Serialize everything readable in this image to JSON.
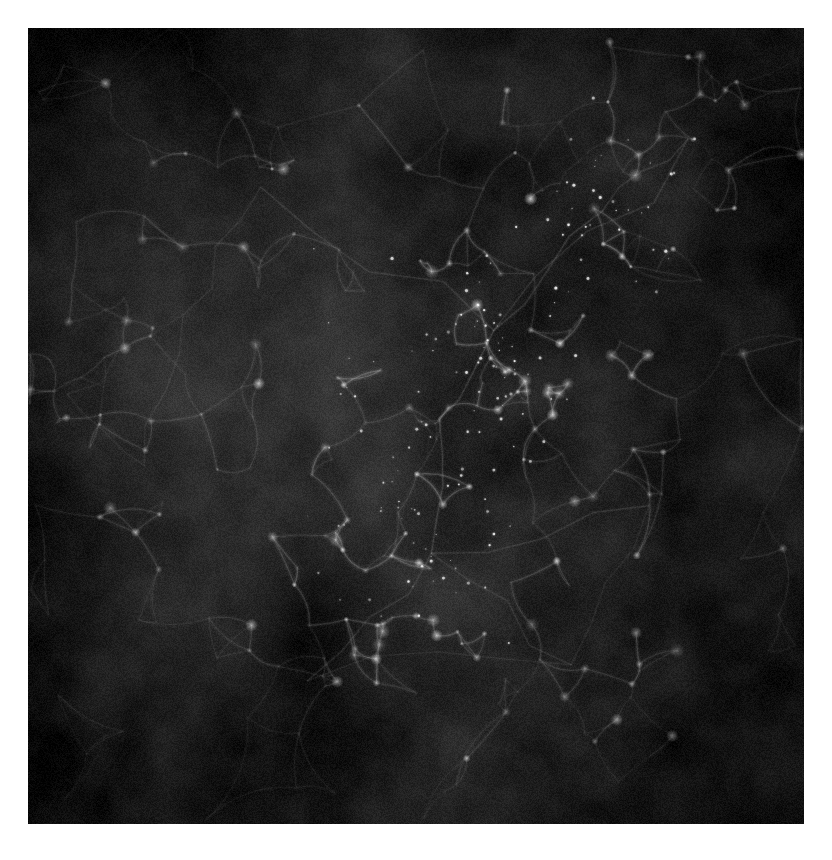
{
  "image": {
    "description": "Grayscale cosmological simulation image of the cosmic web: faint wispy gas filaments and small bright knots forming a network that converges on a dense central cluster, set against a dark mottled, grainy background with a white page margin.",
    "background_page_color": "#ffffff",
    "base_color": "#161616",
    "filament_color": "#ffffff",
    "base_luma": 24,
    "haze_strength": 22,
    "corner_darkening": 10,
    "grain": 18,
    "seed": 1337,
    "nodes_per_cluster": 26,
    "background_nodes": 110,
    "speck_count_scale": 46,
    "clusters": [
      {
        "x": 0.53,
        "y": 0.49,
        "w": 1.0,
        "spread": 0.16
      },
      {
        "x": 0.74,
        "y": 0.23,
        "w": 0.8,
        "spread": 0.1
      },
      {
        "x": 0.6,
        "y": 0.38,
        "w": 0.85,
        "spread": 0.09
      },
      {
        "x": 0.52,
        "y": 0.66,
        "w": 0.75,
        "spread": 0.11
      },
      {
        "x": 0.36,
        "y": 0.82,
        "w": 0.55,
        "spread": 0.1
      },
      {
        "x": 0.8,
        "y": 0.6,
        "w": 0.5,
        "spread": 0.1
      },
      {
        "x": 0.3,
        "y": 0.2,
        "w": 0.5,
        "spread": 0.1
      },
      {
        "x": 0.15,
        "y": 0.55,
        "w": 0.45,
        "spread": 0.09
      },
      {
        "x": 0.2,
        "y": 0.36,
        "w": 0.4,
        "spread": 0.09
      },
      {
        "x": 0.85,
        "y": 0.14,
        "w": 0.45,
        "spread": 0.08
      },
      {
        "x": 0.7,
        "y": 0.8,
        "w": 0.4,
        "spread": 0.09
      },
      {
        "x": 0.05,
        "y": 0.46,
        "w": 0.35,
        "spread": 0.05
      }
    ]
  }
}
